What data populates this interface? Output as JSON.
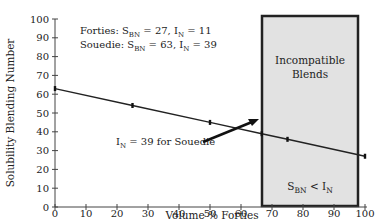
{
  "chart_data": {
    "type": "line",
    "title": "",
    "xlabel": "Volume % Forties",
    "ylabel": "Solubility Blending Number",
    "xlim": [
      0,
      100
    ],
    "ylim": [
      0,
      100
    ],
    "x_ticks": [
      0,
      10,
      20,
      30,
      40,
      50,
      60,
      70,
      80,
      90,
      100
    ],
    "y_ticks": [
      0,
      10,
      20,
      30,
      40,
      50,
      60,
      70,
      80,
      90,
      100
    ],
    "grid": false,
    "series": [
      {
        "name": "Blend S_BN",
        "x": [
          0,
          25,
          50,
          66.7,
          75,
          100
        ],
        "y": [
          63,
          54,
          45,
          39,
          36,
          27
        ]
      }
    ],
    "region": {
      "label_line1": "Incompatible",
      "label_line2": "Blends",
      "condition_main": "S",
      "condition_sub1": "BN",
      "condition_mid": " < I",
      "condition_sub2": "N",
      "x_start": 66.7,
      "x_end": 98,
      "fill": "#e2e2e2"
    },
    "annotations": {
      "legend": [
        {
          "prefix": "Forties: S",
          "sub1": "BN",
          "mid": " = 27, I",
          "sub2": "N",
          "suffix": " = 11"
        },
        {
          "prefix": "Souedie: S",
          "sub1": "BN",
          "mid": " = 63, I",
          "sub2": "N",
          "suffix": " = 39"
        }
      ],
      "arrow_label": {
        "prefix": "I",
        "sub": "N",
        "suffix": " = 39 for Souedie"
      }
    },
    "colors": {
      "line": "#222222",
      "axis": "#444444",
      "box_border": "#222222",
      "box_fill": "#e2e2e2"
    }
  }
}
